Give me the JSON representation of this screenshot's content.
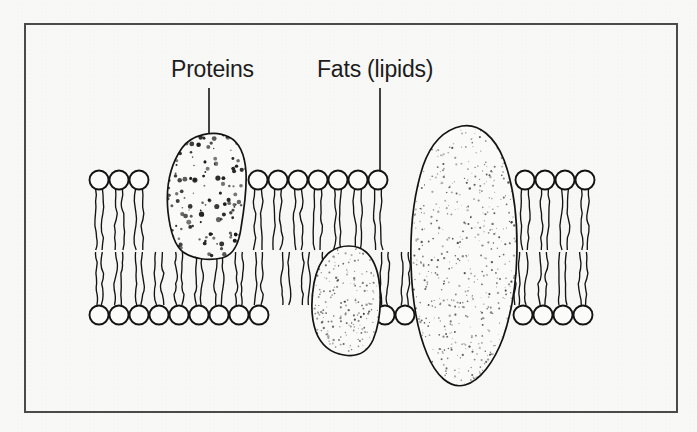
{
  "figure": {
    "title_alt": "Cell membrane phospholipid bilayer diagram",
    "background_color": "#f8f8f7",
    "ink_color": "#141414",
    "border": {
      "color": "#4a4a4a",
      "x": 24,
      "y": 23,
      "width": 654,
      "height": 390,
      "stroke_width": 2
    }
  },
  "labels": {
    "proteins": "Proteins",
    "fats": "Fats (lipids)"
  },
  "leaders": [
    {
      "name": "proteins-leader",
      "x1": 209,
      "y1": 88,
      "x2": 209,
      "y2": 153
    },
    {
      "name": "fats-leader",
      "x1": 380,
      "y1": 88,
      "x2": 380,
      "y2": 186
    }
  ],
  "diagram_data": {
    "type": "diagram",
    "subject": "phospholipid bilayer cell membrane",
    "bilayer": {
      "head_radius": 9.5,
      "head_spacing": 20,
      "upper_head_center_y": 180,
      "lower_head_center_y": 315,
      "upper_tail_top_y": 189,
      "upper_tail_bottom_y": 250,
      "lower_tail_top_y": 252,
      "lower_tail_bottom_y": 305,
      "upper_rows": [
        {
          "name": "upper-left-group",
          "start_x": 99,
          "count": 3
        },
        {
          "name": "upper-middle-group",
          "start_x": 258,
          "count": 7
        },
        {
          "name": "upper-right-group",
          "start_x": 525,
          "count": 4
        }
      ],
      "lower_rows": [
        {
          "name": "lower-left-group",
          "start_x": 99,
          "count": 9
        },
        {
          "name": "lower-middle-group",
          "start_x": 385,
          "count": 2
        },
        {
          "name": "lower-right-group",
          "start_x": 523,
          "count": 4
        }
      ],
      "lower_extra_tails": [
        {
          "name": "lower-left-extra-tails",
          "start_x": 286,
          "count": 4
        },
        {
          "name": "lower-right-extra-tails",
          "start_x": 511,
          "count": 1
        }
      ]
    },
    "proteins": [
      {
        "name": "protein-left",
        "shape": "rounded-blob",
        "bbox": [
          167,
          132,
          79,
          128
        ],
        "stipple": "coarse-dark",
        "stipple_count": 150,
        "labelled_by": "Proteins"
      },
      {
        "name": "protein-middle",
        "shape": "rounded-blob",
        "bbox": [
          311,
          246,
          70,
          110
        ],
        "stipple": "fine-light",
        "stipple_count": 230,
        "labelled_by": "Proteins"
      },
      {
        "name": "protein-right-large",
        "shape": "tall-oval",
        "bbox": [
          411,
          124,
          106,
          262
        ],
        "stipple": "fine-dense",
        "stipple_count": 620,
        "labelled_by": "Proteins"
      }
    ],
    "fats": {
      "name": "phospholipid-molecule",
      "description": "circular hydrophilic head with two wavy hydrophobic tails",
      "labelled_by": "Fats (lipids)"
    }
  }
}
